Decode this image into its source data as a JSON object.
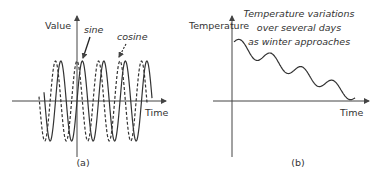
{
  "panel_a": {
    "caption": "(a)",
    "y_label": "Value",
    "x_label": "Time",
    "series": [
      {
        "name": "sine",
        "style": "solid"
      },
      {
        "name": "cosine",
        "style": "dashed"
      }
    ],
    "annotations": {
      "sine": "sine",
      "cosine": "cosine"
    }
  },
  "panel_b": {
    "caption": "(b)",
    "y_label": "Temperature",
    "x_label": "Time",
    "annotation_lines": [
      "Temperature variations",
      "over several days",
      "as winter approaches"
    ]
  },
  "colors": {
    "line": "#333333",
    "axis": "#444444",
    "text": "#333333",
    "background": "#ffffff"
  }
}
